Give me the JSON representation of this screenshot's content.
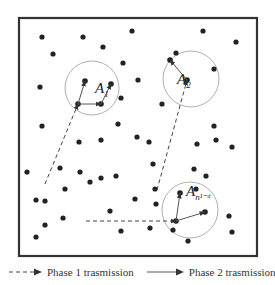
{
  "figure": {
    "frame": {
      "x": 19,
      "y": 18,
      "width": 238,
      "height": 238
    },
    "colors": {
      "frame": "#333333",
      "node": "#222222",
      "circle": "#9a9a9a",
      "arrow": "#444444"
    },
    "nodes": [
      [
        42,
        37
      ],
      [
        83,
        37
      ],
      [
        132,
        31
      ],
      [
        203,
        31
      ],
      [
        236,
        42
      ],
      [
        53,
        54
      ],
      [
        103,
        47
      ],
      [
        176,
        53
      ],
      [
        123,
        63
      ],
      [
        214,
        69
      ],
      [
        40,
        87
      ],
      [
        138,
        80
      ],
      [
        42,
        126
      ],
      [
        118,
        124
      ],
      [
        137,
        137
      ],
      [
        214,
        126
      ],
      [
        232,
        147
      ],
      [
        197,
        144
      ],
      [
        162,
        104
      ],
      [
        121,
        98
      ],
      [
        101,
        140
      ],
      [
        79,
        142
      ],
      [
        149,
        142
      ],
      [
        216,
        140
      ],
      [
        27,
        172
      ],
      [
        60,
        168
      ],
      [
        45,
        201
      ],
      [
        80,
        172
      ],
      [
        101,
        178
      ],
      [
        116,
        176
      ],
      [
        153,
        164
      ],
      [
        196,
        189
      ],
      [
        36,
        200
      ],
      [
        65,
        189
      ],
      [
        155,
        189
      ],
      [
        156,
        204
      ],
      [
        194,
        169
      ],
      [
        135,
        199
      ],
      [
        110,
        211
      ],
      [
        121,
        231
      ],
      [
        45,
        225
      ],
      [
        63,
        218
      ],
      [
        36,
        237
      ],
      [
        150,
        228
      ],
      [
        229,
        216
      ],
      [
        232,
        232
      ],
      [
        188,
        241
      ],
      [
        206,
        176
      ],
      [
        173,
        230
      ],
      [
        90,
        182
      ]
    ],
    "clusters": [
      {
        "id": "A1",
        "cx": 92,
        "cy": 88,
        "r": 27,
        "label_main": "A",
        "label_sub": "1",
        "label_x": 95,
        "label_y": 93,
        "members": [
          [
            85,
            81
          ],
          [
            111,
            84
          ],
          [
            78,
            104
          ],
          [
            101,
            104
          ]
        ]
      },
      {
        "id": "A2",
        "cx": 191,
        "cy": 79,
        "r": 28,
        "label_main": "A",
        "label_sub": "2",
        "label_x": 177,
        "label_y": 84,
        "members": [
          [
            170,
            60
          ],
          [
            187,
            80
          ]
        ]
      },
      {
        "id": "An",
        "cx": 190,
        "cy": 210,
        "r": 28,
        "label_main": "A",
        "label_sub": "n¹⁻ᵈ",
        "label_x": 186,
        "label_y": 196,
        "members": [
          [
            180,
            193
          ],
          [
            205,
            212
          ],
          [
            176,
            221
          ]
        ]
      }
    ],
    "phase1_paths": [
      {
        "points": [
          [
            45,
            184
          ],
          [
            78,
            104
          ]
        ]
      },
      {
        "points": [
          [
            157,
            190
          ],
          [
            187,
            80
          ]
        ]
      },
      {
        "points": [
          [
            86,
            221
          ],
          [
            176,
            221
          ]
        ]
      }
    ],
    "phase2_paths": [
      {
        "from": [
          78,
          104
        ],
        "to": [
          85,
          81
        ]
      },
      {
        "from": [
          78,
          104
        ],
        "to": [
          101,
          104
        ]
      },
      {
        "from": [
          101,
          104
        ],
        "to": [
          111,
          84
        ]
      },
      {
        "from": [
          187,
          80
        ],
        "to": [
          170,
          60
        ]
      },
      {
        "from": [
          176,
          221
        ],
        "to": [
          180,
          193
        ]
      },
      {
        "from": [
          176,
          221
        ],
        "to": [
          205,
          212
        ]
      }
    ]
  },
  "legend": {
    "phase1_label": "Phase 1 trasmission",
    "phase2_label": "Phase 2 trasmission"
  }
}
